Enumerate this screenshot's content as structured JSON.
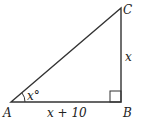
{
  "diagram": {
    "type": "right-triangle",
    "vertices": {
      "A": {
        "label": "A",
        "x": 11,
        "y": 102
      },
      "B": {
        "label": "B",
        "x": 121,
        "y": 102
      },
      "C": {
        "label": "C",
        "x": 121,
        "y": 8
      }
    },
    "sides": {
      "AB": {
        "label": "x + 10"
      },
      "BC": {
        "label": "x"
      }
    },
    "angles": {
      "A": {
        "label": "x°"
      },
      "B": {
        "right_angle": true
      }
    },
    "colors": {
      "stroke": "#333333",
      "text": "#222222",
      "background": "#ffffff"
    }
  }
}
